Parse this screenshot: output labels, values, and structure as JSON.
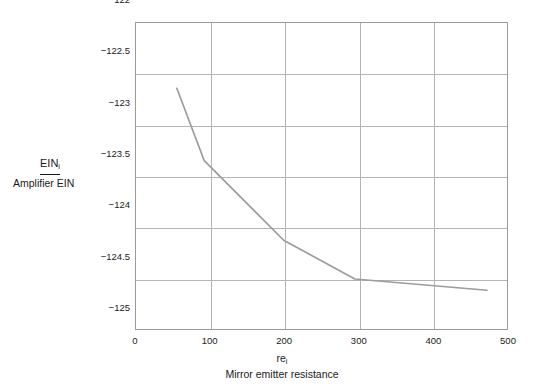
{
  "chart_data": {
    "type": "line",
    "title": "",
    "xlabel": "re",
    "xlabel_sub": "i",
    "xlabel_desc": "Mirror emitter resistance",
    "ylabel": "EIN",
    "ylabel_sub": "i",
    "ylabel_desc": "Amplifier EIN",
    "xlim": [
      0,
      500
    ],
    "ylim": [
      -125,
      -122
    ],
    "xticks": [
      0,
      100,
      200,
      300,
      400,
      500
    ],
    "xtick_labels": [
      "0",
      "100",
      "200",
      "300",
      "400",
      "500"
    ],
    "yticks": [
      -122,
      -122.5,
      -123,
      -123.5,
      -124,
      -124.5,
      -125
    ],
    "ytick_labels": [
      "−122",
      "−122.5",
      "−123",
      "−123.5",
      "−124",
      "−124.5",
      "−125"
    ],
    "grid": true,
    "legend": null,
    "line_color": "#9c9c9c",
    "grid_color": "#b4b4b4",
    "frame_color": "#9a9a9a",
    "x": [
      55,
      92,
      199,
      295,
      473
    ],
    "values": [
      -122.64,
      -123.35,
      -124.13,
      -124.51,
      -124.62
    ],
    "series": [
      {
        "name": "Amplifier EIN",
        "points": [
          {
            "x": 55,
            "y": -122.64
          },
          {
            "x": 92,
            "y": -123.35
          },
          {
            "x": 199,
            "y": -124.13
          },
          {
            "x": 295,
            "y": -124.51
          },
          {
            "x": 473,
            "y": -124.62
          }
        ]
      }
    ]
  }
}
